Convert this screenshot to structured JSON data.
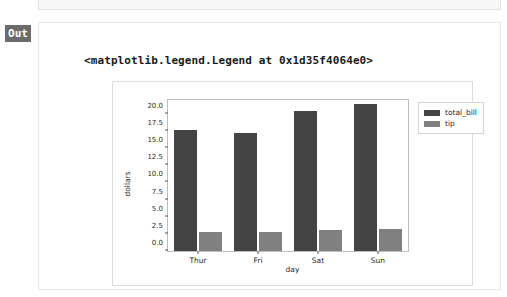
{
  "notebook": {
    "prompt_label": "Out",
    "output_text": "<matplotlib.legend.Legend at 0x1d35f4064e0>"
  },
  "colors": {
    "total_bill": "#444444",
    "tip": "#808080",
    "prompt_badge": "#6b6b6b",
    "axes_frame": "#bdbdbd",
    "figure_border": "#dcdcdc"
  },
  "chart_data": {
    "type": "bar",
    "title": "",
    "xlabel": "day",
    "ylabel": "dollars",
    "categories": [
      "Thur",
      "Fri",
      "Sat",
      "Sun"
    ],
    "series": [
      {
        "name": "total_bill",
        "values": [
          17.68,
          17.15,
          20.44,
          21.41
        ]
      },
      {
        "name": "tip",
        "values": [
          2.77,
          2.73,
          2.99,
          3.26
        ]
      }
    ],
    "ylim": [
      0.0,
      22.0
    ],
    "yticks": [
      0.0,
      2.5,
      5.0,
      7.5,
      10.0,
      12.5,
      15.0,
      17.5,
      20.0
    ],
    "ytick_labels": [
      "0.0",
      "2.5",
      "5.0",
      "7.5",
      "10.0",
      "12.5",
      "15.0",
      "17.5",
      "20.0"
    ],
    "grid": false,
    "legend": {
      "position": "upper right outside",
      "entries": [
        "total_bill",
        "tip"
      ]
    }
  }
}
